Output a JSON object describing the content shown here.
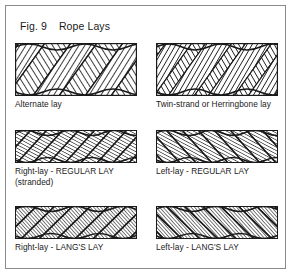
{
  "figure": {
    "label": "Fig. 9",
    "title": "Rope Lays",
    "title_line": "Fig. 9    Rope Lays",
    "border_color": "#8a8a8a",
    "background_color": "#ffffff",
    "ink_color": "#1a1a1a"
  },
  "diagrams": [
    {
      "id": "alternate-lay",
      "caption": "Alternate lay",
      "strand_direction": "alternating",
      "rope_style": "thick-6-strand",
      "row": 1,
      "column": 1
    },
    {
      "id": "twin-strand-herringbone-lay",
      "caption": "Twin-strand or Herringbone lay",
      "strand_direction": "alternating-pairs",
      "rope_style": "thick-6-strand",
      "row": 1,
      "column": 2
    },
    {
      "id": "right-lay-regular-lay",
      "caption": "Right-lay - REGULAR LAY\n(stranded)",
      "strand_direction": "right",
      "wire_direction": "left",
      "rope_style": "thin-stranded",
      "row": 2,
      "column": 1
    },
    {
      "id": "left-lay-regular-lay",
      "caption": "Left-lay - REGULAR LAY",
      "strand_direction": "left",
      "wire_direction": "right",
      "rope_style": "thin-stranded",
      "row": 2,
      "column": 2
    },
    {
      "id": "right-lay-langs-lay",
      "caption": "Right-lay - LANG'S LAY",
      "strand_direction": "right",
      "wire_direction": "right",
      "rope_style": "thin-langs",
      "row": 3,
      "column": 1
    },
    {
      "id": "left-lay-langs-lay",
      "caption": "Left-lay - LANG'S LAY",
      "strand_direction": "left",
      "wire_direction": "left",
      "rope_style": "thin-langs",
      "row": 3,
      "column": 2
    }
  ]
}
